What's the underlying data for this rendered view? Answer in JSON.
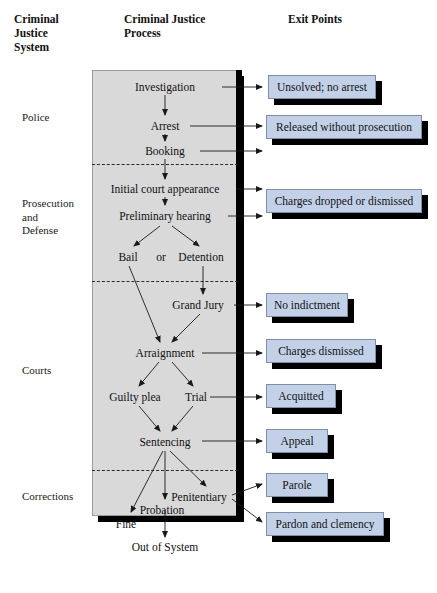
{
  "headers": {
    "system": "Criminal\nJustice\nSystem",
    "process": "Criminal Justice\nProcess",
    "exit": "Exit Points"
  },
  "stages": [
    {
      "id": "police",
      "label": "Police"
    },
    {
      "id": "prosecution",
      "label": "Prosecution\nand\nDefense"
    },
    {
      "id": "courts",
      "label": "Courts"
    },
    {
      "id": "corrections",
      "label": "Corrections"
    }
  ],
  "process_nodes": [
    {
      "id": "investigation",
      "label": "Investigation"
    },
    {
      "id": "arrest",
      "label": "Arrest"
    },
    {
      "id": "booking",
      "label": "Booking"
    },
    {
      "id": "initial-court",
      "label": "Initial court appearance"
    },
    {
      "id": "preliminary",
      "label": "Preliminary hearing"
    },
    {
      "id": "bail",
      "label": "Bail"
    },
    {
      "id": "or",
      "label": "or"
    },
    {
      "id": "detention",
      "label": "Detention"
    },
    {
      "id": "grand-jury",
      "label": "Grand Jury"
    },
    {
      "id": "arraignment",
      "label": "Arraignment"
    },
    {
      "id": "guilty-plea",
      "label": "Guilty plea"
    },
    {
      "id": "trial",
      "label": "Trial"
    },
    {
      "id": "sentencing",
      "label": "Sentencing"
    },
    {
      "id": "penitentiary",
      "label": "Penitentiary"
    },
    {
      "id": "probation",
      "label": "Probation"
    },
    {
      "id": "fine",
      "label": "Fine"
    }
  ],
  "exit_points": [
    {
      "id": "unsolved",
      "label": "Unsolved; no arrest"
    },
    {
      "id": "released",
      "label": "Released without prosecution"
    },
    {
      "id": "dropped",
      "label": "Charges dropped or dismissed"
    },
    {
      "id": "no-indict",
      "label": "No indictment"
    },
    {
      "id": "dismissed",
      "label": "Charges dismissed"
    },
    {
      "id": "acquitted",
      "label": "Acquitted"
    },
    {
      "id": "appeal",
      "label": "Appeal"
    },
    {
      "id": "parole",
      "label": "Parole"
    },
    {
      "id": "pardon",
      "label": "Pardon and clemency"
    }
  ],
  "terminal": {
    "label": "Out of System"
  },
  "colors": {
    "process_fill": "#d9d9d9",
    "exit_fill": "#c3d1e8",
    "exit_border": "#7d8ea8",
    "shadow": "#000000",
    "text": "#111111"
  }
}
